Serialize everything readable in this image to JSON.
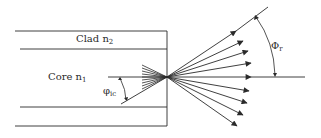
{
  "labels": {
    "clad": {
      "text": "Clad n",
      "sub": "2"
    },
    "core": {
      "text": "Core n",
      "sub": "1"
    },
    "phi_ic": {
      "text": "φ",
      "sub": "ic"
    },
    "phi_r": {
      "text": "Φ",
      "sub": "r"
    }
  },
  "colors": {
    "line": "#2a2a2a",
    "background": "#ffffff"
  },
  "geometry": {
    "exit_point": [
      167,
      77
    ],
    "fiber_right_edge": 167,
    "boundaries_y": [
      31,
      49,
      107,
      126
    ],
    "incoming_rays_count": 9,
    "outgoing_rays_count": 9
  }
}
